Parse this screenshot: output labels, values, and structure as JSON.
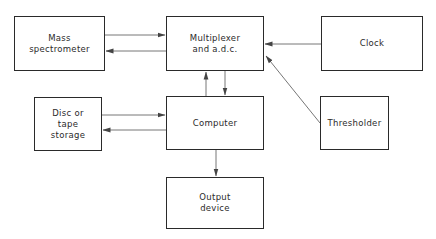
{
  "diagram": {
    "title": "",
    "nodes": {
      "mass_spectrometer": {
        "label": "Mass\nspectrometer"
      },
      "multiplexer": {
        "label": "Multiplexer\nand a.d.c."
      },
      "clock": {
        "label": "Clock"
      },
      "disc": {
        "label": "Disc or\ntape\nstorage"
      },
      "computer": {
        "label": "Computer"
      },
      "thresholder": {
        "label": "Thresholder"
      },
      "output": {
        "label": "Output\ndevice"
      }
    },
    "edges": [
      {
        "from": "Mass spectrometer",
        "to": "Multiplexer and a.d.c."
      },
      {
        "from": "Multiplexer and a.d.c.",
        "to": "Mass spectrometer"
      },
      {
        "from": "Clock",
        "to": "Multiplexer and a.d.c."
      },
      {
        "from": "Thresholder",
        "to": "Multiplexer and a.d.c."
      },
      {
        "from": "Computer",
        "to": "Multiplexer and a.d.c."
      },
      {
        "from": "Multiplexer and a.d.c.",
        "to": "Computer"
      },
      {
        "from": "Disc or tape storage",
        "to": "Computer"
      },
      {
        "from": "Computer",
        "to": "Disc or tape storage"
      },
      {
        "from": "Computer",
        "to": "Output device"
      }
    ],
    "colors": {
      "line": "#555555",
      "border": "#2a2a2a",
      "text": "#2b2b2b",
      "background": "#ffffff"
    }
  }
}
